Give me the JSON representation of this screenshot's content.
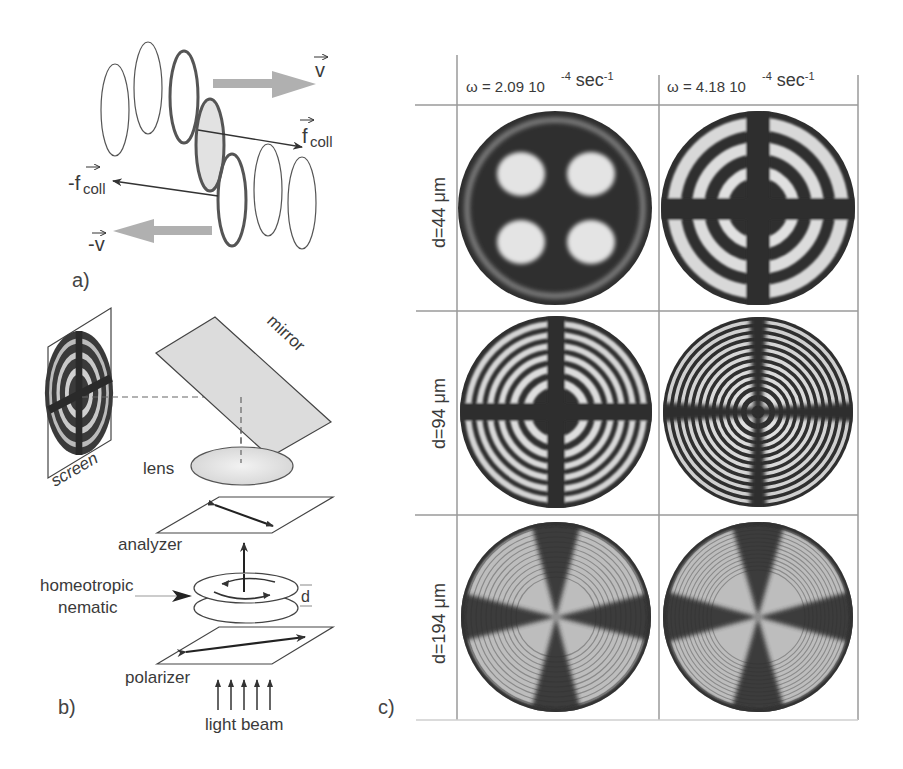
{
  "figure": {
    "panels": {
      "a": {
        "label": "a)",
        "vectors": {
          "v": "v",
          "minus_v": "-v",
          "f_coll_base": "f",
          "f_coll_sub": "coll",
          "minus_f_coll_base": "-f",
          "minus_f_coll_sub": "coll"
        },
        "arrow_color": "#b0b0b0"
      },
      "b": {
        "label": "b)",
        "components": {
          "screen": "screen",
          "mirror": "mirror",
          "lens": "lens",
          "analyzer": "analyzer",
          "sample_line1": "homeotropic",
          "sample_line2": "nematic",
          "thickness": "d",
          "polarizer": "polarizer",
          "light": "light beam"
        },
        "mirror_color": "#dcdcdc",
        "lens_color": "#e6e6e6"
      },
      "c": {
        "label": "c)",
        "columns": [
          {
            "omega_prefix": "ω = 2.09 10",
            "exp1": "-4",
            "unit": " sec",
            "exp2": "-1"
          },
          {
            "omega_prefix": "ω = 4.18 10",
            "exp1": "-4",
            "unit": " sec",
            "exp2": "-1"
          }
        ],
        "rows": [
          {
            "label": "d=44 μm",
            "rings": [
              1,
              3
            ]
          },
          {
            "label": "d=94 μm",
            "rings": [
              6,
              12
            ]
          },
          {
            "label": "d=194 μm",
            "rings": [
              14,
              16
            ]
          }
        ],
        "grid_color": "#9a9a9a",
        "dark_color": "#2e2e2e",
        "light_color": "#d8d8d8"
      }
    }
  }
}
